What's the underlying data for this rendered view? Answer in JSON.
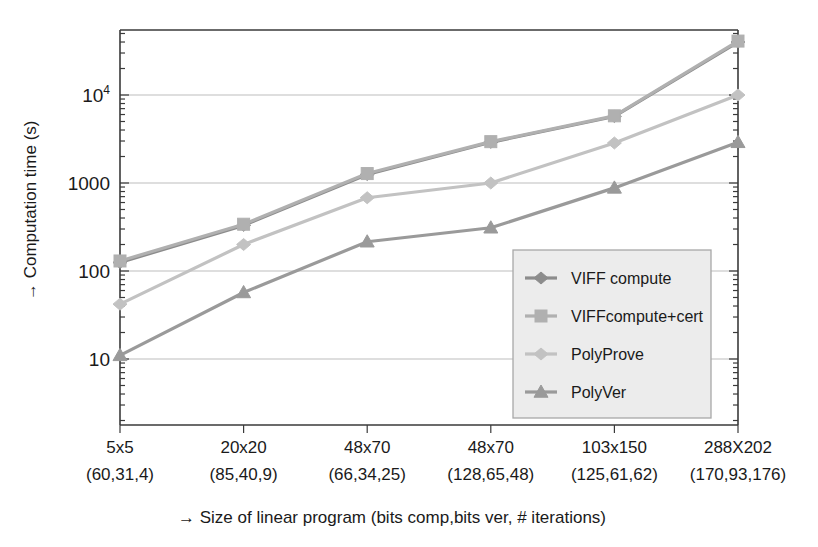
{
  "chart_data": {
    "type": "line",
    "title": "",
    "xlabel": "→ Size of linear program (bits comp,bits ver, # iterations)",
    "ylabel": "→ Computation time (s)",
    "yscale": "log",
    "ylim": [
      5,
      60000
    ],
    "grid": true,
    "legend_position": "inside-bottom-right",
    "categories": [
      "5x5",
      "20x20",
      "48x70",
      "48x70",
      "103x150",
      "288X202"
    ],
    "category_sublabels": [
      "(60,31,4)",
      "(85,40,9)",
      "(66,34,25)",
      "(128,65,48)",
      "(125,61,62)",
      "(170,93,176)"
    ],
    "ytick_labels": [
      "10",
      "100",
      "1000",
      "10⁴"
    ],
    "ytick_values": [
      10,
      100,
      1000,
      10000
    ],
    "series": [
      {
        "name": "VIFF compute",
        "marker": "diamond",
        "color": "#8c8c8c",
        "values": [
          125,
          330,
          1250,
          2900,
          5700,
          40000
        ]
      },
      {
        "name": "VIFFcompute+cert",
        "marker": "square",
        "color": "#b0b0b0",
        "values": [
          130,
          340,
          1280,
          2950,
          5800,
          41000
        ]
      },
      {
        "name": "PolyProve",
        "marker": "diamond",
        "color": "#c2c2c2",
        "values": [
          42,
          200,
          680,
          1000,
          2850,
          10000
        ]
      },
      {
        "name": "PolyVer",
        "marker": "triangle",
        "color": "#9a9a9a",
        "values": [
          11,
          57,
          215,
          310,
          880,
          2900
        ]
      }
    ]
  },
  "axis": {
    "y_title": "→ Computation time (s)",
    "x_title": "→ Size of linear program (bits comp,bits ver, # iterations)"
  },
  "legend": {
    "items": [
      {
        "label": "VIFF compute"
      },
      {
        "label": "VIFFcompute+cert"
      },
      {
        "label": "PolyProve"
      },
      {
        "label": "PolyVer"
      }
    ]
  },
  "colors": {
    "axis": "#3a3a3a",
    "grid": "#bdbdbd",
    "legend_bg": "#ececec",
    "legend_border": "#a8a8a8"
  }
}
